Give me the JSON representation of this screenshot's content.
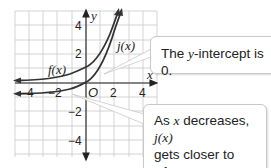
{
  "graph": {
    "x_axis_label": "x",
    "y_axis_label": "y",
    "origin_label": "O",
    "x_ticks": [
      "−4",
      "−2",
      "2",
      "4"
    ],
    "y_ticks": [
      "4",
      "2",
      "−2",
      "−4"
    ],
    "x_range": [
      -6,
      6
    ],
    "y_range": [
      -5.5,
      5.5
    ],
    "curves": [
      {
        "name": "f(x)",
        "label": "f(x)",
        "asymptote": 0,
        "y_intercept": 1
      },
      {
        "name": "j(x)",
        "label": "j(x)",
        "asymptote": -1,
        "y_intercept": 0
      }
    ],
    "colors": {
      "curve": "#333333",
      "grid": "#c8c8c8",
      "axis": "#222222"
    }
  },
  "callouts": {
    "intercept": {
      "prefix": "The ",
      "var": "y",
      "suffix": "-intercept is 0."
    },
    "asymptote": {
      "line1_prefix": "As ",
      "line1_var": "x",
      "line1_mid": " decreases, ",
      "line1_func": "j(x)",
      "line2": "gets closer to −1."
    }
  }
}
